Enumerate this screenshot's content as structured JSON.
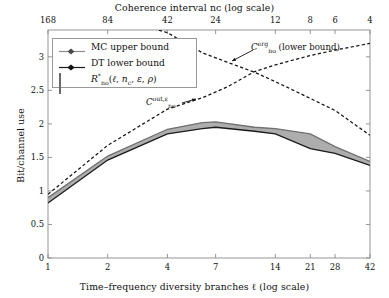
{
  "figure": {
    "top_axis_title": "Coherence interval nᴄ (log scale)",
    "bottom_axis_title": "Time–frequency diversity branches ℓ (log scale)",
    "y_axis_title": "Bit/channel use"
  },
  "legend": {
    "items": [
      {
        "label": "MC upper bound",
        "style": "line-marker",
        "color": "#8c8c8c"
      },
      {
        "label": "DT lower bound",
        "style": "line-marker",
        "color": "#1a1a1a"
      },
      {
        "label": "R*ₙₒ(ℓ, nᴄ, ε, ρ)",
        "style": "patch",
        "color": "#a8a8a8"
      }
    ]
  },
  "annotations": [
    {
      "id": "erg",
      "text": "Cᵉʳᵍₙₒ (lower bound)"
    },
    {
      "id": "out",
      "text": "Cᵒᵘᵗᴬεₙₒ"
    }
  ],
  "chart_data": {
    "type": "line",
    "title": "",
    "xlabel": "Time–frequency diversity branches ℓ (log scale)",
    "ylabel": "Bit/channel use",
    "x_tick_labels": [
      "1",
      "2",
      "4",
      "7",
      "14",
      "21",
      "28",
      "42"
    ],
    "x_tick_values": [
      1,
      2,
      4,
      7,
      14,
      21,
      28,
      42
    ],
    "x_scale": "log",
    "xlim": [
      1,
      42
    ],
    "top_axis_label": "Coherence interval nᴄ (log scale)",
    "top_tick_labels": [
      "168",
      "84",
      "42",
      "24",
      "12",
      "8",
      "6",
      "4"
    ],
    "top_tick_values": [
      168,
      84,
      42,
      24,
      12,
      8,
      6,
      4
    ],
    "y_tick_labels": [
      "0",
      "0.5",
      "1",
      "1.5",
      "2",
      "2.5",
      "3"
    ],
    "y_tick_values": [
      0,
      0.5,
      1,
      1.5,
      2,
      2.5,
      3
    ],
    "ylim": [
      0,
      3.4
    ],
    "grid": false,
    "legend_position": "upper-left",
    "series": [
      {
        "name": "MC upper bound",
        "style": "solid",
        "color": "#6e6e6e",
        "x": [
          1,
          2,
          4,
          6,
          7,
          11,
          14,
          21,
          28,
          42
        ],
        "values": [
          0.9,
          1.52,
          1.92,
          2.02,
          2.03,
          1.95,
          1.93,
          1.85,
          1.66,
          1.44
        ]
      },
      {
        "name": "DT lower bound",
        "style": "solid",
        "color": "#1a1a1a",
        "x": [
          1,
          2,
          4,
          6,
          7,
          11,
          14,
          21,
          28,
          42
        ],
        "values": [
          0.82,
          1.46,
          1.85,
          1.93,
          1.95,
          1.89,
          1.85,
          1.63,
          1.56,
          1.38
        ]
      },
      {
        "name": "C_no^{out,eps}",
        "style": "dashed",
        "color": "#1a1a1a",
        "x": [
          1,
          2,
          4,
          6,
          8,
          11,
          14,
          21,
          28,
          42
        ],
        "values": [
          0.95,
          1.68,
          2.22,
          2.39,
          2.55,
          2.78,
          2.88,
          3.02,
          3.1,
          3.2
        ]
      },
      {
        "name": "C_no^{erg}",
        "style": "dashed",
        "color": "#1a1a1a",
        "x": [
          3.4,
          4,
          6,
          8,
          11,
          14,
          21,
          28,
          42
        ],
        "values": [
          3.42,
          3.36,
          3.06,
          2.92,
          2.77,
          2.63,
          2.38,
          2.2,
          1.83
        ]
      }
    ]
  }
}
